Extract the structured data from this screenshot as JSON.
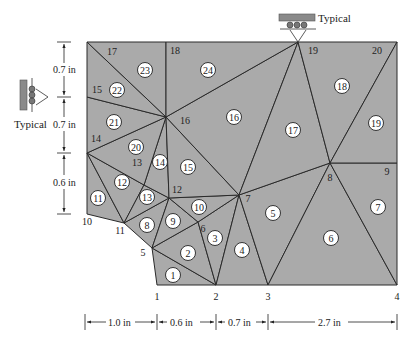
{
  "diagram": {
    "fill_color": "#aaaaaa",
    "line_color": "#2a2a2a",
    "nodes": [
      {
        "id": "1",
        "x": 157,
        "y": 285,
        "lx": 157,
        "ly": 300
      },
      {
        "id": "2",
        "x": 216,
        "y": 285,
        "lx": 216,
        "ly": 300
      },
      {
        "id": "3",
        "x": 268,
        "y": 285,
        "lx": 268,
        "ly": 300
      },
      {
        "id": "4",
        "x": 397,
        "y": 285,
        "lx": 397,
        "ly": 300
      },
      {
        "id": "5",
        "x": 152,
        "y": 248,
        "lx": 143,
        "ly": 256
      },
      {
        "id": "6",
        "x": 198,
        "y": 222,
        "lx": 203,
        "ly": 232
      },
      {
        "id": "7",
        "x": 239,
        "y": 195,
        "lx": 248,
        "ly": 202
      },
      {
        "id": "8",
        "x": 330,
        "y": 163,
        "lx": 330,
        "ly": 181
      },
      {
        "id": "9",
        "x": 397,
        "y": 163,
        "lx": 387,
        "ly": 175
      },
      {
        "id": "10",
        "x": 87,
        "y": 214,
        "lx": 87,
        "ly": 225
      },
      {
        "id": "11",
        "x": 124,
        "y": 223,
        "lx": 120,
        "ly": 234
      },
      {
        "id": "12",
        "x": 169,
        "y": 198,
        "lx": 177,
        "ly": 193
      },
      {
        "id": "13",
        "x": 144,
        "y": 185,
        "lx": 137,
        "ly": 166
      },
      {
        "id": "14",
        "x": 87,
        "y": 153,
        "lx": 96,
        "ly": 142
      },
      {
        "id": "15",
        "x": 87,
        "y": 97,
        "lx": 97,
        "ly": 93
      },
      {
        "id": "16",
        "x": 166,
        "y": 117,
        "lx": 185,
        "ly": 124
      },
      {
        "id": "17",
        "x": 87,
        "y": 42,
        "lx": 112,
        "ly": 55
      },
      {
        "id": "18",
        "x": 166,
        "y": 42,
        "lx": 175,
        "ly": 54
      },
      {
        "id": "19",
        "x": 298,
        "y": 42,
        "lx": 313,
        "ly": 54
      },
      {
        "id": "20",
        "x": 397,
        "y": 42,
        "lx": 377,
        "ly": 54
      }
    ],
    "elements": [
      {
        "id": "1",
        "nodes": [
          "1",
          "2",
          "5"
        ],
        "cx": 173,
        "cy": 275
      },
      {
        "id": "2",
        "nodes": [
          "5",
          "2",
          "6"
        ],
        "cx": 188,
        "cy": 253
      },
      {
        "id": "3",
        "nodes": [
          "6",
          "2",
          "7"
        ],
        "cx": 215,
        "cy": 238
      },
      {
        "id": "4",
        "nodes": [
          "2",
          "3",
          "7"
        ],
        "cx": 242,
        "cy": 250
      },
      {
        "id": "5",
        "nodes": [
          "7",
          "3",
          "8"
        ],
        "cx": 273,
        "cy": 213
      },
      {
        "id": "6",
        "nodes": [
          "3",
          "4",
          "8"
        ],
        "cx": 331,
        "cy": 238
      },
      {
        "id": "7",
        "nodes": [
          "8",
          "4",
          "9"
        ],
        "cx": 378,
        "cy": 207
      },
      {
        "id": "8",
        "nodes": [
          "11",
          "5",
          "12"
        ],
        "cx": 147,
        "cy": 225
      },
      {
        "id": "9",
        "nodes": [
          "12",
          "5",
          "6"
        ],
        "cx": 173,
        "cy": 221
      },
      {
        "id": "10",
        "nodes": [
          "12",
          "6",
          "7"
        ],
        "cx": 199,
        "cy": 207
      },
      {
        "id": "11",
        "nodes": [
          "10",
          "11",
          "14"
        ],
        "cx": 98,
        "cy": 198
      },
      {
        "id": "12",
        "nodes": [
          "14",
          "11",
          "13"
        ],
        "cx": 122,
        "cy": 182
      },
      {
        "id": "13",
        "nodes": [
          "13",
          "11",
          "12"
        ],
        "cx": 147,
        "cy": 197
      },
      {
        "id": "14",
        "nodes": [
          "13",
          "12",
          "16"
        ],
        "cx": 160,
        "cy": 162
      },
      {
        "id": "15",
        "nodes": [
          "16",
          "12",
          "7"
        ],
        "cx": 188,
        "cy": 167
      },
      {
        "id": "16",
        "nodes": [
          "16",
          "7",
          "19"
        ],
        "cx": 234,
        "cy": 117
      },
      {
        "id": "17",
        "nodes": [
          "7",
          "8",
          "19"
        ],
        "cx": 293,
        "cy": 130
      },
      {
        "id": "18",
        "nodes": [
          "19",
          "8",
          "20"
        ],
        "cx": 342,
        "cy": 86
      },
      {
        "id": "19",
        "nodes": [
          "20",
          "8",
          "9"
        ],
        "cx": 376,
        "cy": 123
      },
      {
        "id": "20",
        "nodes": [
          "14",
          "13",
          "16"
        ],
        "cx": 136,
        "cy": 147
      },
      {
        "id": "21",
        "nodes": [
          "14",
          "16",
          "15"
        ],
        "cx": 114,
        "cy": 122
      },
      {
        "id": "22",
        "nodes": [
          "15",
          "16",
          "17"
        ],
        "cx": 117,
        "cy": 90
      },
      {
        "id": "23",
        "nodes": [
          "17",
          "16",
          "18"
        ],
        "cx": 145,
        "cy": 70
      },
      {
        "id": "24",
        "nodes": [
          "18",
          "16",
          "19"
        ],
        "cx": 208,
        "cy": 70
      }
    ],
    "supports": [
      {
        "label": "Typical",
        "type": "roller-vertical",
        "node": "15"
      },
      {
        "label": "Typical",
        "type": "roller-horizontal",
        "node": "19"
      }
    ],
    "dimensions": {
      "vertical": [
        {
          "label": "0.7 in",
          "y1": 42,
          "y2": 97
        },
        {
          "label": "0.7 in",
          "y1": 97,
          "y2": 153
        },
        {
          "label": "0.6 in",
          "y1": 153,
          "y2": 214
        }
      ],
      "horizontal": [
        {
          "label": "1.0 in",
          "x1": 85,
          "x2": 157
        },
        {
          "label": "0.6 in",
          "x1": 157,
          "x2": 216
        },
        {
          "label": "0.7 in",
          "x1": 216,
          "x2": 268
        },
        {
          "label": "2.7 in",
          "x1": 268,
          "x2": 397
        }
      ]
    }
  }
}
